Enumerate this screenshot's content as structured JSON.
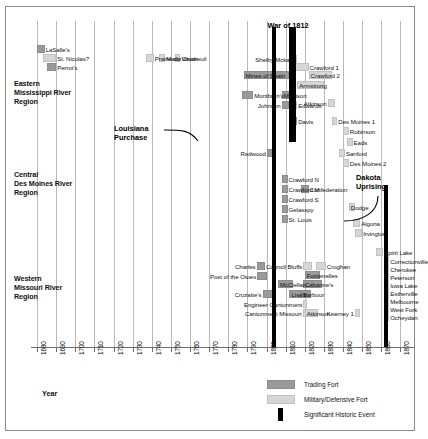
{
  "chart_data": {
    "type": "timeline",
    "title": "",
    "xlabel": "Year",
    "xlim": [
      1680,
      1875
    ],
    "grid": true,
    "xticks": [
      1680,
      1690,
      1700,
      1710,
      1720,
      1730,
      1740,
      1750,
      1760,
      1770,
      1780,
      1790,
      1800,
      1810,
      1820,
      1830,
      1840,
      1850,
      1860,
      1870
    ],
    "region_labels": [
      {
        "id": "eastern",
        "lines": [
          "Eastern",
          "Mississippi River",
          "Region"
        ]
      },
      {
        "id": "central",
        "lines": [
          "Central",
          "Des Moines River",
          "Region"
        ]
      },
      {
        "id": "western",
        "lines": [
          "Western",
          "Missouri River",
          "Region"
        ]
      }
    ],
    "annotations": [
      {
        "id": "war-of-1812",
        "label": "War of 1812",
        "year": 1812
      },
      {
        "id": "louisiana-purchase",
        "label_lines": [
          "Louisiana",
          "Purchase"
        ],
        "year": 1803
      },
      {
        "id": "dakota-uprising",
        "label_lines": [
          "Dakota",
          "Uprising"
        ],
        "year": 1862
      }
    ],
    "events": [
      {
        "name": "War of 1812",
        "type": "event",
        "start": 1812,
        "end": 1815
      },
      {
        "name": "Louisiana Purchase",
        "type": "event",
        "start": 1803,
        "end": 1804
      },
      {
        "name": "Dakota Uprising",
        "type": "event",
        "start": 1862,
        "end": 1863
      }
    ],
    "series": [
      {
        "region": "Eastern Mississippi River Region",
        "items": [
          {
            "name": "LaSalle's",
            "type": "trading",
            "start": 1680,
            "end": 1684,
            "label_side": "right"
          },
          {
            "name": "St. Nicolas?",
            "type": "military",
            "start": 1683,
            "end": 1690,
            "label_side": "right"
          },
          {
            "name": "Perrot's",
            "type": "trading",
            "start": 1685,
            "end": 1690,
            "label_side": "right"
          },
          {
            "name": "Prairie du Chien",
            "type": "military",
            "start": 1737,
            "end": 1741,
            "label_side": "right"
          },
          {
            "name": "Marin",
            "type": "military",
            "start": 1744,
            "end": 1747,
            "label_side": "right"
          },
          {
            "name": "Vaudreuil",
            "type": "military",
            "start": 1752,
            "end": 1755,
            "label_side": "right"
          },
          {
            "name": "Shelby/Mckay",
            "type": "military",
            "start": 1814,
            "end": 1816,
            "label_side": "left"
          },
          {
            "name": "Crawford 1",
            "type": "military",
            "start": 1815,
            "end": 1822,
            "label_side": "right"
          },
          {
            "name": "Mines of Spain",
            "type": "trading",
            "start": 1788,
            "end": 1812,
            "label_side": "inside"
          },
          {
            "name": "Crawford 2",
            "type": "military",
            "start": 1822,
            "end": 1834,
            "label_side": "inside"
          },
          {
            "name": "Armstrong",
            "type": "military",
            "start": 1816,
            "end": 1830,
            "label_side": "inside"
          },
          {
            "name": "Montbrun's",
            "type": "trading",
            "start": 1787,
            "end": 1793,
            "label_side": "right"
          },
          {
            "name": "Madison",
            "type": "trading",
            "start": 1808,
            "end": 1813,
            "label_side": "inside"
          },
          {
            "name": "Atkinson",
            "type": "military",
            "start": 1832,
            "end": 1836,
            "label_side": "left"
          },
          {
            "name": "Johnson",
            "type": "trading",
            "start": 1808,
            "end": 1812,
            "label_side": "left"
          },
          {
            "name": "Edwards",
            "type": "military",
            "start": 1813,
            "end": 1816,
            "label_side": "right"
          },
          {
            "name": "Des Moines 1",
            "type": "military",
            "start": 1834,
            "end": 1837,
            "label_side": "right"
          },
          {
            "name": "Davis",
            "type": "trading",
            "start": 1813,
            "end": 1816,
            "label_side": "right"
          },
          {
            "name": "Robinson",
            "type": "military",
            "start": 1840,
            "end": 1843,
            "label_side": "right"
          }
        ]
      },
      {
        "region": "Central Des Moines River Region",
        "items": [
          {
            "name": "Eads",
            "type": "military",
            "start": 1842,
            "end": 1845,
            "label_side": "right"
          },
          {
            "name": "Redwood",
            "type": "trading",
            "start": 1800,
            "end": 1804,
            "label_side": "left"
          },
          {
            "name": "Sanford",
            "type": "military",
            "start": 1838,
            "end": 1841,
            "label_side": "right"
          },
          {
            "name": "Des Moines 2",
            "type": "military",
            "start": 1840,
            "end": 1843,
            "label_side": "right"
          },
          {
            "name": "Crawford N",
            "type": "trading",
            "start": 1808,
            "end": 1811,
            "label_side": "right"
          },
          {
            "name": "Crawford M",
            "type": "trading",
            "start": 1808,
            "end": 1811,
            "label_side": "right"
          },
          {
            "name": "Confederation",
            "type": "trading",
            "start": 1818,
            "end": 1822,
            "label_side": "right"
          },
          {
            "name": "Crawford S",
            "type": "trading",
            "start": 1808,
            "end": 1811,
            "label_side": "right"
          },
          {
            "name": "Dodge",
            "type": "military",
            "start": 1843,
            "end": 1846,
            "label_side": "inside"
          },
          {
            "name": "Gelasspy",
            "type": "trading",
            "start": 1808,
            "end": 1811,
            "label_side": "right"
          },
          {
            "name": "Algona",
            "type": "military",
            "start": 1845,
            "end": 1849,
            "label_side": "right"
          },
          {
            "name": "St. Louis",
            "type": "trading",
            "start": 1808,
            "end": 1811,
            "label_side": "right"
          },
          {
            "name": "Irvington",
            "type": "military",
            "start": 1846,
            "end": 1850,
            "label_side": "right"
          }
        ]
      },
      {
        "region": "Western Missouri River Region",
        "items": [
          {
            "name": "Spirit Lake",
            "type": "military",
            "start": 1857,
            "end": 1861,
            "label_side": "right"
          },
          {
            "name": "Charles",
            "type": "trading",
            "start": 1795,
            "end": 1799,
            "label_side": "left"
          },
          {
            "name": "Council Bluffs",
            "type": "military",
            "start": 1819,
            "end": 1824,
            "label_side": "left"
          },
          {
            "name": "Croghan",
            "type": "military",
            "start": 1826,
            "end": 1831,
            "label_side": "right"
          },
          {
            "name": "Post of the Otoes",
            "type": "trading",
            "start": 1795,
            "end": 1800,
            "label_side": "left"
          },
          {
            "name": "Fontenelles",
            "type": "trading",
            "start": 1820,
            "end": 1828,
            "label_side": "inside"
          },
          {
            "name": "McClellan",
            "type": "trading",
            "start": 1806,
            "end": 1814,
            "label_side": "inside"
          },
          {
            "name": "Cabanne's",
            "type": "trading",
            "start": 1819,
            "end": 1829,
            "label_side": "inside"
          },
          {
            "name": "Cruzatte's",
            "type": "trading",
            "start": 1798,
            "end": 1804,
            "label_side": "left"
          },
          {
            "name": "Lisa's",
            "type": "trading",
            "start": 1812,
            "end": 1818,
            "label_side": "inside"
          },
          {
            "name": "Barbour",
            "type": "trading",
            "start": 1818,
            "end": 1823,
            "label_side": "inside"
          },
          {
            "name": "Engineer Cantonment",
            "type": "military",
            "start": 1819,
            "end": 1821,
            "label_side": "left"
          },
          {
            "name": "Cantonment Missouri",
            "type": "military",
            "start": 1819,
            "end": 1820,
            "label_side": "left"
          },
          {
            "name": "Atkinson",
            "type": "military",
            "start": 1820,
            "end": 1827,
            "label_side": "inside"
          },
          {
            "name": "Kearney 1",
            "type": "military",
            "start": 1846,
            "end": 1849,
            "label_side": "left"
          },
          {
            "name": "Correctionville",
            "type": "military",
            "start": 1862,
            "end": 1864,
            "label_side": "right"
          },
          {
            "name": "Cherokee",
            "type": "military",
            "start": 1862,
            "end": 1864,
            "label_side": "right"
          },
          {
            "name": "Peterson",
            "type": "military",
            "start": 1862,
            "end": 1864,
            "label_side": "right"
          },
          {
            "name": "Iowa Lake",
            "type": "military",
            "start": 1862,
            "end": 1864,
            "label_side": "right"
          },
          {
            "name": "Estherville",
            "type": "military",
            "start": 1862,
            "end": 1864,
            "label_side": "right"
          },
          {
            "name": "Melbourne",
            "type": "military",
            "start": 1862,
            "end": 1864,
            "label_side": "right"
          },
          {
            "name": "West Fork",
            "type": "military",
            "start": 1862,
            "end": 1864,
            "label_side": "right"
          },
          {
            "name": "Ocheydan",
            "type": "military",
            "start": 1862,
            "end": 1864,
            "label_side": "right"
          }
        ]
      }
    ],
    "legend": {
      "position": "bottom-right",
      "entries": [
        {
          "label": "Trading Fort",
          "type": "trading",
          "color": "#9a9a9a"
        },
        {
          "label": "Military/Defensive Fort",
          "type": "military",
          "color": "#d6d6d6"
        },
        {
          "label": "Significant Historic Event",
          "type": "event",
          "color": "#000000"
        }
      ]
    }
  },
  "axis": {
    "title": "Year",
    "ticks": [
      "1680",
      "1690",
      "1700",
      "1710",
      "1720",
      "1730",
      "1740",
      "1750",
      "1760",
      "1770",
      "1780",
      "1790",
      "1800",
      "1810",
      "1820",
      "1830",
      "1840",
      "1850",
      "1860",
      "1870"
    ]
  },
  "regions": {
    "eastern": {
      "l1": "Eastern",
      "l2": "Mississippi River",
      "l3": "Region"
    },
    "central": {
      "l1": "Central",
      "l2": "Des Moines River",
      "l3": "Region"
    },
    "western": {
      "l1": "Western",
      "l2": "Missouri River",
      "l3": "Region"
    }
  },
  "annotations": {
    "war": "War of 1812",
    "lp1": "Louisiana",
    "lp2": "Purchase",
    "du1": "Dakota",
    "du2": "Uprising"
  },
  "legend": {
    "trading": "Trading Fort",
    "military": "Military/Defensive Fort",
    "event": "Significant Historic Event"
  }
}
